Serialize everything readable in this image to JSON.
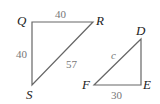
{
  "triangles": [
    {
      "name": "QRS",
      "vertices": {
        "Q": "Q",
        "R": "R",
        "S": "S"
      },
      "sides": {
        "QR": "40",
        "QS": "40",
        "RS": "57"
      }
    },
    {
      "name": "DEF",
      "vertices": {
        "D": "D",
        "E": "E",
        "F": "F"
      },
      "sides": {
        "DF": "c",
        "FE": "30"
      }
    }
  ],
  "colors": {
    "lines": "#666666",
    "vertex_labels": "#222222",
    "side_labels": "#777777"
  }
}
